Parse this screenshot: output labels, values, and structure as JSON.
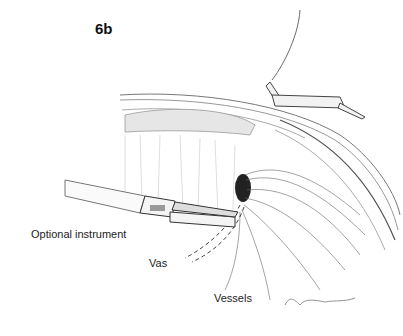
{
  "figure": {
    "label": "6b",
    "annotations": [
      {
        "id": "instrument",
        "text": "Optional instrument"
      },
      {
        "id": "vas",
        "text": "Vas"
      },
      {
        "id": "vessels",
        "text": "Vessels"
      }
    ],
    "signature": "Starmer",
    "colors": {
      "background": "#ffffff",
      "ink": "#222222",
      "sketch": "#888888"
    }
  }
}
